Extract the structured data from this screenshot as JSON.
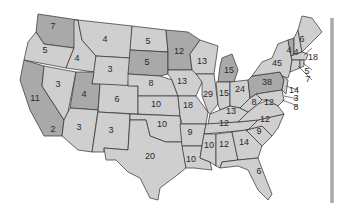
{
  "map": {
    "title": "",
    "colors": {
      "light": "#cfcfcf",
      "dark": "#a9a9a9",
      "border": "#2e2e2e",
      "text": "#2a2a2a"
    },
    "states": [
      {
        "id": "WA",
        "value": "7",
        "shade": "dark"
      },
      {
        "id": "OR",
        "value": "5",
        "shade": "light"
      },
      {
        "id": "CA",
        "value": "11",
        "shade": "dark"
      },
      {
        "id": "CA_S",
        "value": "2",
        "shade": "light"
      },
      {
        "id": "NV",
        "value": "3",
        "shade": "light"
      },
      {
        "id": "ID",
        "value": "4",
        "shade": "light"
      },
      {
        "id": "MT",
        "value": "4",
        "shade": "light"
      },
      {
        "id": "WY",
        "value": "3",
        "shade": "light"
      },
      {
        "id": "UT",
        "value": "4",
        "shade": "dark"
      },
      {
        "id": "AZ",
        "value": "3",
        "shade": "light"
      },
      {
        "id": "CO",
        "value": "6",
        "shade": "light"
      },
      {
        "id": "NM",
        "value": "3",
        "shade": "light"
      },
      {
        "id": "ND",
        "value": "5",
        "shade": "light"
      },
      {
        "id": "SD",
        "value": "5",
        "shade": "dark"
      },
      {
        "id": "NE",
        "value": "8",
        "shade": "light"
      },
      {
        "id": "KS",
        "value": "10",
        "shade": "light"
      },
      {
        "id": "OK",
        "value": "10",
        "shade": "light"
      },
      {
        "id": "TX",
        "value": "20",
        "shade": "light"
      },
      {
        "id": "MN",
        "value": "12",
        "shade": "dark"
      },
      {
        "id": "IA",
        "value": "13",
        "shade": "light"
      },
      {
        "id": "MO",
        "value": "18",
        "shade": "light"
      },
      {
        "id": "AR",
        "value": "9",
        "shade": "light"
      },
      {
        "id": "LA",
        "value": "10",
        "shade": "light"
      },
      {
        "id": "WI",
        "value": "13",
        "shade": "light"
      },
      {
        "id": "IL",
        "value": "29",
        "shade": "light"
      },
      {
        "id": "MI",
        "value": "15",
        "shade": "dark"
      },
      {
        "id": "IN",
        "value": "15",
        "shade": "light"
      },
      {
        "id": "OH",
        "value": "24",
        "shade": "light"
      },
      {
        "id": "KY",
        "value": "13",
        "shade": "light"
      },
      {
        "id": "TN",
        "value": "12",
        "shade": "light"
      },
      {
        "id": "MS",
        "value": "10",
        "shade": "light"
      },
      {
        "id": "AL",
        "value": "12",
        "shade": "light"
      },
      {
        "id": "GA",
        "value": "14",
        "shade": "light"
      },
      {
        "id": "FL",
        "value": "6",
        "shade": "light"
      },
      {
        "id": "SC",
        "value": "9",
        "shade": "light"
      },
      {
        "id": "NC",
        "value": "12",
        "shade": "light"
      },
      {
        "id": "VA",
        "value": "12",
        "shade": "light"
      },
      {
        "id": "WV",
        "value": "8",
        "shade": "light"
      },
      {
        "id": "PA",
        "value": "38",
        "shade": "dark"
      },
      {
        "id": "NY",
        "value": "45",
        "shade": "light"
      },
      {
        "id": "VT",
        "value": "4",
        "shade": "dark"
      },
      {
        "id": "NH",
        "value": "4",
        "shade": "light"
      },
      {
        "id": "ME",
        "value": "6",
        "shade": "light"
      },
      {
        "id": "MA",
        "value": "18",
        "shade": "light"
      },
      {
        "id": "RI",
        "value": "5",
        "shade": "light"
      },
      {
        "id": "CT",
        "value": "7",
        "shade": "light"
      },
      {
        "id": "NJ",
        "value": "14",
        "shade": "light"
      },
      {
        "id": "DE",
        "value": "3",
        "shade": "light"
      },
      {
        "id": "MD",
        "value": "8",
        "shade": "light"
      }
    ]
  }
}
